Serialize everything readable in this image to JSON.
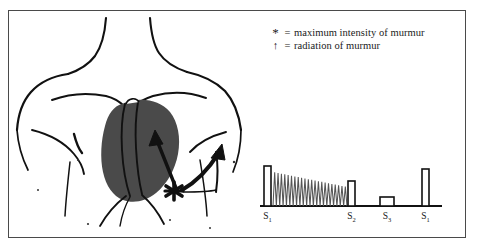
{
  "figure": {
    "border_color": "#4a4a4a",
    "background_color": "#ffffff"
  },
  "legend": {
    "rows": [
      {
        "symbol": "*",
        "symbol_name": "asterisk-symbol",
        "equals": "=",
        "text": "maximum intensity of murmur"
      },
      {
        "symbol": "↑",
        "symbol_name": "up-arrow-symbol",
        "equals": "=",
        "text": "radiation of murmur"
      }
    ]
  },
  "anatomy": {
    "name": "chest-torso-illustration",
    "outline_color": "#111111",
    "heart_fill_color": "#4a4a4a",
    "markers": {
      "max_intensity_marker": "*",
      "radiation_arrow_count": 2
    }
  },
  "chart_data": {
    "type": "bar",
    "xlabel": "",
    "ylabel": "",
    "grid": false,
    "legend": "none",
    "categories": [
      "S1",
      "S2",
      "S3",
      "S1"
    ],
    "tick_labels": [
      "S",
      "S",
      "S",
      "S"
    ],
    "tick_subscripts": [
      "1",
      "2",
      "3",
      "1"
    ],
    "values": [
      1.0,
      0.62,
      0.22,
      0.92
    ],
    "ylim": [
      0,
      1.1
    ],
    "bars": [
      {
        "label": "S1",
        "subscript": "1",
        "x": 14,
        "width": 7,
        "height": 40
      },
      {
        "label": "S2",
        "subscript": "2",
        "x": 98,
        "width": 7,
        "height": 25
      },
      {
        "label": "S3",
        "subscript": "3",
        "x": 130,
        "width": 14,
        "height": 9
      },
      {
        "label": "S1",
        "subscript": "1",
        "x": 172,
        "width": 7,
        "height": 37
      }
    ],
    "murmur": {
      "name": "decrescendo-murmur-waveform",
      "shape": "decrescendo",
      "start_x": 23,
      "end_x": 97,
      "start_height": 34,
      "end_height": 19,
      "oscillation_count": 22
    },
    "baseline": {
      "x1": 10,
      "x2": 192,
      "y": 41
    }
  }
}
